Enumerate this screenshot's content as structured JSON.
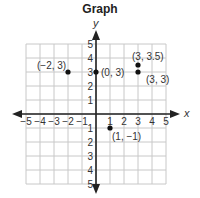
{
  "chart_data": {
    "type": "scatter",
    "title": "Graph",
    "xlabel": "x",
    "ylabel": "y",
    "xlim": [
      -5,
      5
    ],
    "ylim": [
      -5,
      5
    ],
    "grid": true,
    "x_ticks": [
      -5,
      -4,
      -3,
      -2,
      -1,
      1,
      2,
      3,
      4,
      5
    ],
    "y_ticks": [
      -5,
      -4,
      -3,
      -2,
      -1,
      1,
      2,
      3,
      4,
      5
    ],
    "x_tick_labels": [
      "−5",
      "−4",
      "−3",
      "−2",
      "−1",
      "1",
      "2",
      "3",
      "4",
      "5"
    ],
    "y_tick_labels": [
      "5",
      "4",
      "3",
      "2",
      "1",
      "1",
      "2",
      "3",
      "4",
      "5"
    ],
    "points": [
      {
        "x": -2,
        "y": 3,
        "label": "(−2, 3)"
      },
      {
        "x": 0,
        "y": 3,
        "label": "(0, 3)"
      },
      {
        "x": 3,
        "y": 3.5,
        "label": "(3, 3.5)"
      },
      {
        "x": 3,
        "y": 3,
        "label": "(3, 3)"
      },
      {
        "x": 1,
        "y": -1,
        "label": "(1, −1)"
      }
    ]
  },
  "title": "Graph",
  "axes": {
    "x_name": "x",
    "y_name": "y"
  }
}
